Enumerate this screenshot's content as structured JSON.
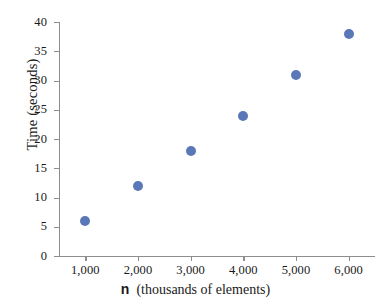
{
  "chart_data": {
    "type": "scatter",
    "title": "",
    "xlabel": "n  (thousands of elements)",
    "xlabel_variable": "n",
    "xlabel_units": "(thousands of elements)",
    "ylabel": "Time (seconds)",
    "x": [
      1000,
      2000,
      3000,
      4000,
      5000,
      6000
    ],
    "values": [
      6,
      12,
      18,
      24,
      31,
      38
    ],
    "series": [
      {
        "name": "Time",
        "values": [
          6,
          12,
          18,
          24,
          31,
          38
        ]
      }
    ],
    "points": [
      {
        "x": 1000,
        "y": 6
      },
      {
        "x": 2000,
        "y": 12
      },
      {
        "x": 3000,
        "y": 18
      },
      {
        "x": 4000,
        "y": 24
      },
      {
        "x": 5000,
        "y": 31
      },
      {
        "x": 6000,
        "y": 38
      }
    ],
    "xtick_labels": [
      "1,000",
      "2,000",
      "3,000",
      "4,000",
      "5,000",
      "6,000"
    ],
    "xtick_values": [
      1000,
      2000,
      3000,
      4000,
      5000,
      6000
    ],
    "ytick_labels": [
      "0",
      "5",
      "10",
      "15",
      "20",
      "25",
      "30",
      "35",
      "40"
    ],
    "ytick_values": [
      0,
      5,
      10,
      15,
      20,
      25,
      30,
      35,
      40
    ],
    "xlim": [
      500,
      6500
    ],
    "ylim": [
      0,
      40
    ],
    "grid": false,
    "legend": "none",
    "marker_color": "#5a78b8",
    "axis_color": "#8d8d8d",
    "background_color": "#ffffff"
  }
}
